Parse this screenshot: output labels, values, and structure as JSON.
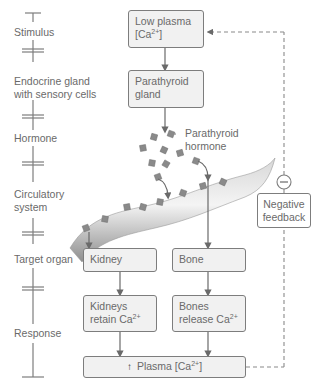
{
  "timeline": {
    "stages": [
      {
        "label": "Stimulus"
      },
      {
        "label_line1": "Endocrine gland",
        "label_line2": "with sensory cells"
      },
      {
        "label": "Hormone"
      },
      {
        "label_line1": "Circulatory",
        "label_line2": "system"
      },
      {
        "label": "Target organ"
      },
      {
        "label": "Response"
      }
    ]
  },
  "flow": {
    "stimulus_box": {
      "line1": "Low plasma",
      "line2_prefix": "[Ca",
      "line2_sup": "2+",
      "line2_suffix": "]"
    },
    "gland_box": {
      "line1": "Parathyroid",
      "line2": "gland"
    },
    "hormone_label": {
      "line1": "Parathyroid",
      "line2": "hormone"
    },
    "kidney_box": {
      "label": "Kidney"
    },
    "bone_box": {
      "label": "Bone"
    },
    "kidney_response": {
      "line1": "Kidneys",
      "line2_prefix": "retain Ca",
      "line2_sup": "2+"
    },
    "bone_response": {
      "line1": "Bones",
      "line2_prefix": "release Ca",
      "line2_sup": "2+"
    },
    "result_box": {
      "arrow": "↑",
      "prefix": "Plasma [Ca",
      "sup": "2+",
      "suffix": "]"
    },
    "feedback": {
      "symbol": "−",
      "line1": "Negative",
      "line2": "feedback"
    }
  },
  "colors": {
    "line": "#7d7d7d",
    "box_fill": "#f1f1f1",
    "hormone_particle": "#8a8a8a",
    "vessel": "#b8b8b8"
  }
}
